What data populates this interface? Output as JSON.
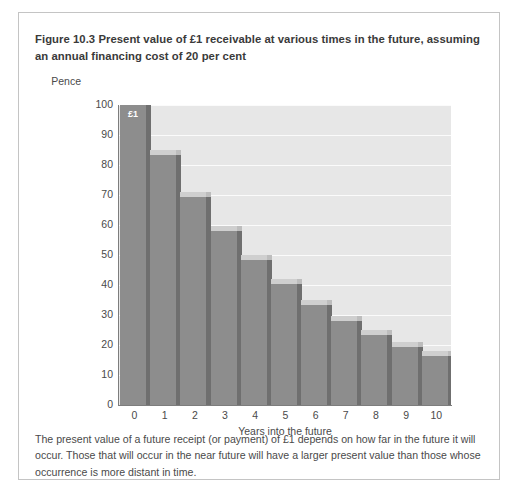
{
  "figure": {
    "number_label": "Figure 10.3",
    "title": "Present value of £1 receivable at various times in the future, assuming an annual financing cost of 20 per cent",
    "title_full": "Figure 10.3  Present value of £1 receivable at various times in the future, assuming an annual financing cost of 20 per cent",
    "caption": "The present value of a future receipt (or payment) of £1 depends on how far in the future it will occur. Those that will occur in the near future will have a larger present value than those whose occurrence is more distant in time."
  },
  "colors": {
    "plot_background": "#e7e7e7",
    "gridline": "#fbfbfb",
    "bar_front": "#8d8d8d",
    "bar_side": "#6f6f6f",
    "bar_top": "#cfcfcf",
    "axis": "#7d7d7d",
    "text": "#4a4a4a",
    "title_text": "#3a3a3a",
    "box_border": "#c4c4c4",
    "page_background": "#ffffff",
    "data_label_text": "#ffffff"
  },
  "chart_data": {
    "type": "bar",
    "title": "Present value of £1 receivable at various times in the future, assuming an annual financing cost of 20 per cent",
    "subtitle": "",
    "xlabel": "Years into the future",
    "ylabel": "Pence",
    "categories": [
      "0",
      "1",
      "2",
      "3",
      "4",
      "5",
      "6",
      "7",
      "8",
      "9",
      "10"
    ],
    "values": [
      100,
      83.3,
      69.4,
      57.9,
      48.2,
      40.2,
      33.5,
      27.9,
      23.3,
      19.4,
      16.2
    ],
    "ylim": [
      0,
      100
    ],
    "ytick_labels": [
      "100",
      "90",
      "80",
      "70",
      "60",
      "50",
      "40",
      "30",
      "20",
      "10",
      "0"
    ],
    "ytick_values": [
      100,
      90,
      80,
      70,
      60,
      50,
      40,
      30,
      20,
      10,
      0
    ],
    "xtick_labels": [
      "0",
      "1",
      "2",
      "3",
      "4",
      "5",
      "6",
      "7",
      "8",
      "9",
      "10"
    ],
    "grid": true,
    "grid_axis": "y",
    "legend": false,
    "legend_position": "none",
    "style": "3d-column",
    "annotations": [
      {
        "label": "£1",
        "category": "0",
        "value": 100,
        "position": "inside-top"
      }
    ]
  }
}
